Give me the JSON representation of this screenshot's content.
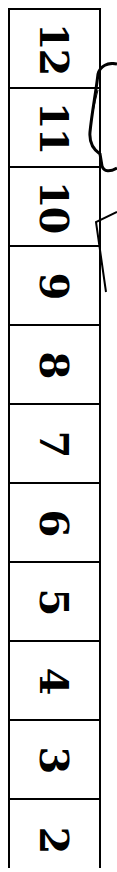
{
  "strip": {
    "cells": [
      {
        "label": "12"
      },
      {
        "label": "11"
      },
      {
        "label": "10"
      },
      {
        "label": "9"
      },
      {
        "label": "8"
      },
      {
        "label": "7"
      },
      {
        "label": "6"
      },
      {
        "label": "5"
      },
      {
        "label": "4"
      },
      {
        "label": "3"
      },
      {
        "label": "2"
      }
    ]
  }
}
